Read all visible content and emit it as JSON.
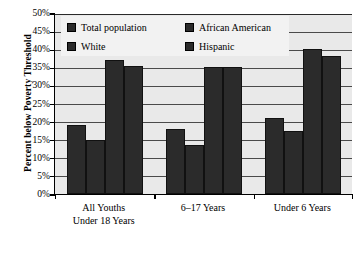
{
  "chart_data": {
    "type": "bar",
    "title": "",
    "xlabel": "",
    "ylabel": "Percent below Poverty Threshold",
    "ylim": [
      0,
      50
    ],
    "grid": true,
    "legend_position": "top-inside",
    "categories": [
      "All Youths Under 18 Years",
      "6–17 Years",
      "Under 6 Years"
    ],
    "category_lines": [
      [
        "All Youths",
        "Under 18 Years"
      ],
      [
        "6–17 Years"
      ],
      [
        "Under 6 Years"
      ]
    ],
    "ytick_labels": [
      "0%",
      "5%",
      "10%",
      "15%",
      "20%",
      "25%",
      "30%",
      "35%",
      "40%",
      "45%",
      "50%"
    ],
    "ytick_values": [
      0,
      5,
      10,
      15,
      20,
      25,
      30,
      35,
      40,
      45,
      50
    ],
    "series": [
      {
        "name": "Total population",
        "color": "#2b2b2b",
        "values": [
          19.0,
          18.0,
          21.0
        ]
      },
      {
        "name": "White",
        "color": "#2b2b2b",
        "values": [
          15.0,
          13.5,
          17.5
        ]
      },
      {
        "name": "African American",
        "color": "#2b2b2b",
        "values": [
          37.0,
          35.0,
          40.0
        ]
      },
      {
        "name": "Hispanic",
        "color": "#2b2b2b",
        "values": [
          35.5,
          35.0,
          38.0
        ]
      }
    ]
  },
  "legend": {
    "items": [
      {
        "label": "Total population"
      },
      {
        "label": "African American"
      },
      {
        "label": "White"
      },
      {
        "label": "Hispanic"
      }
    ]
  },
  "colors": {
    "bar": "#2b2b2b",
    "plot_background": "#e9e9e9",
    "gridline": "#4a4a4a",
    "axis": "#000000",
    "legend_background": "#f2f2f2",
    "page_background": "#ffffff"
  }
}
